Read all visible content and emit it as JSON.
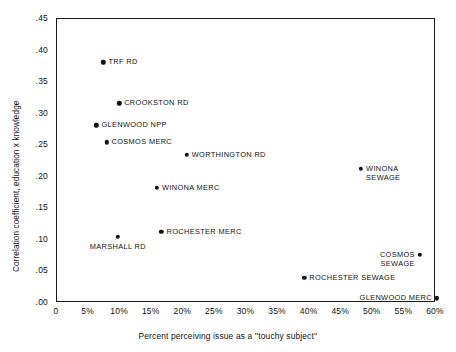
{
  "chart_data": {
    "type": "scatter",
    "title": "",
    "xlabel": "Percent perceiving issue as a ''touchy subject''",
    "ylabel": "Correlation coefficient, education x knowledge",
    "xlim": [
      0,
      60
    ],
    "ylim": [
      0.0,
      0.45
    ],
    "grid": false,
    "legend": "none",
    "x_tick_labels": [
      "0",
      "5%",
      "10%",
      "15%",
      "20%",
      "25%",
      "30%",
      "35%",
      "40%",
      "45%",
      "50%",
      "55%",
      "60%"
    ],
    "x_tick_values": [
      0,
      5,
      10,
      15,
      20,
      25,
      30,
      35,
      40,
      45,
      50,
      55,
      60
    ],
    "y_tick_labels": [
      ".45",
      ".40",
      ".35",
      ".30",
      ".25",
      ".20",
      ".15",
      ".10",
      ".05",
      ".00"
    ],
    "y_tick_values": [
      0.45,
      0.4,
      0.35,
      0.3,
      0.25,
      0.2,
      0.15,
      0.1,
      0.05,
      0.0
    ],
    "marker_color": "#101010",
    "points": [
      {
        "label": "TRF RD",
        "x": 7.5,
        "y": 0.38,
        "label_pos": "right"
      },
      {
        "label": "CROOKSTON RD",
        "x": 10.0,
        "y": 0.315,
        "label_pos": "right"
      },
      {
        "label": "GLENWOOD NPP",
        "x": 6.4,
        "y": 0.28,
        "label_pos": "right"
      },
      {
        "label": "COSMOS MERC",
        "x": 8.0,
        "y": 0.253,
        "label_pos": "right"
      },
      {
        "label": "WORTHINGTON RD",
        "x": 20.7,
        "y": 0.233,
        "label_pos": "right"
      },
      {
        "label": "WINONA\nSEWAGE",
        "x": 48.3,
        "y": 0.211,
        "label_pos": "rightblock"
      },
      {
        "label": "WINONA MERC",
        "x": 16.0,
        "y": 0.181,
        "label_pos": "right"
      },
      {
        "label": "ROCHESTER MERC",
        "x": 16.7,
        "y": 0.111,
        "label_pos": "right"
      },
      {
        "label": "MARSHALL RD",
        "x": 9.8,
        "y": 0.103,
        "label_pos": "below"
      },
      {
        "label": "COSMOS\nSEWAGE",
        "x": 57.6,
        "y": 0.075,
        "label_pos": "leftblock"
      },
      {
        "label": "ROCHESTER SEWAGE",
        "x": 39.3,
        "y": 0.038,
        "label_pos": "right"
      },
      {
        "label": "GLENWOOD MERC",
        "x": 60.3,
        "y": 0.006,
        "label_pos": "left"
      }
    ]
  }
}
